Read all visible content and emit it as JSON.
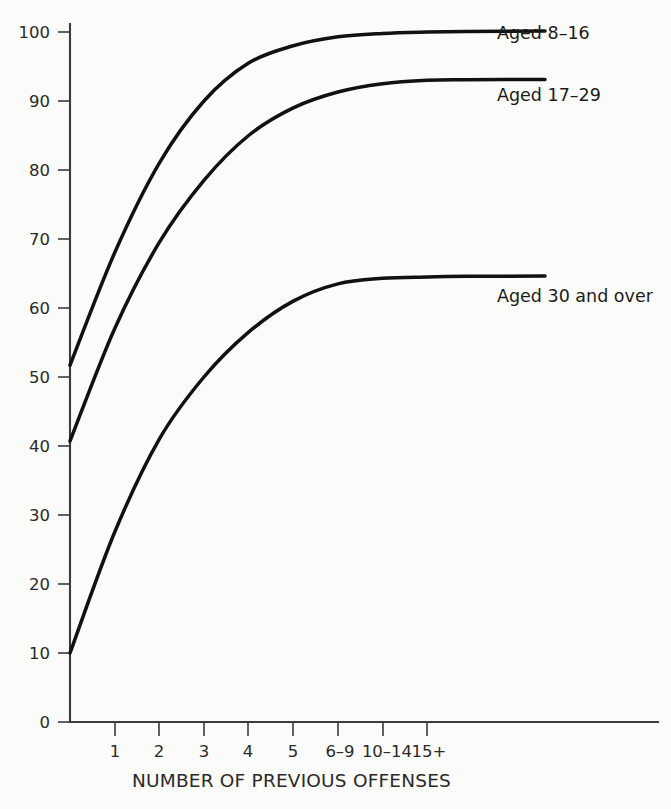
{
  "chart_data": {
    "type": "line",
    "title": "",
    "xlabel": "NUMBER OF PREVIOUS OFFENSES",
    "ylabel": "",
    "categories": [
      "0",
      "1",
      "2",
      "3",
      "4",
      "5",
      "6–9",
      "10–14",
      "15+"
    ],
    "xtick_labels": [
      "1",
      "2",
      "3",
      "4",
      "5",
      "6–9",
      "10–14",
      "15+"
    ],
    "ytick_labels": [
      "0",
      "10",
      "20",
      "30",
      "40",
      "50",
      "60",
      "70",
      "80",
      "90",
      "100"
    ],
    "ylim": [
      0,
      100
    ],
    "ytick_values": [
      0,
      10,
      20,
      30,
      40,
      50,
      60,
      70,
      80,
      90,
      100
    ],
    "grid": false,
    "legend_position": "inline-right-of-curve-ends",
    "line_color": "#111111",
    "axis_color": "#3b3b3b",
    "background_color": "#fbfbf9",
    "series": [
      {
        "name": "Aged 8–16",
        "label": "Aged 8–16",
        "values": [
          51.7,
          68.0,
          81.0,
          90.0,
          95.5,
          98.0,
          99.3,
          99.8,
          100.0
        ]
      },
      {
        "name": "Aged 17–29",
        "label": "Aged 17–29",
        "values": [
          40.7,
          57.0,
          69.5,
          78.5,
          85.0,
          89.0,
          91.3,
          92.5,
          93.0
        ]
      },
      {
        "name": "Aged 30 and over",
        "label": "Aged 30 and over",
        "values": [
          10.0,
          27.5,
          41.0,
          50.0,
          56.5,
          61.0,
          63.5,
          64.3,
          64.5
        ]
      }
    ]
  },
  "axis": {
    "x_title": "NUMBER OF PREVIOUS OFFENSES"
  },
  "series_labels": {
    "s0": "Aged 8–16",
    "s1": "Aged 17–29",
    "s2": "Aged 30 and over"
  },
  "yticks": {
    "t0": "0",
    "t1": "10",
    "t2": "20",
    "t3": "30",
    "t4": "40",
    "t5": "50",
    "t6": "60",
    "t7": "70",
    "t8": "80",
    "t9": "90",
    "t10": "100"
  },
  "xticks": {
    "t0": "1",
    "t1": "2",
    "t2": "3",
    "t3": "4",
    "t4": "5",
    "t5": "6–9",
    "t6": "10–14",
    "t7": "15+"
  }
}
